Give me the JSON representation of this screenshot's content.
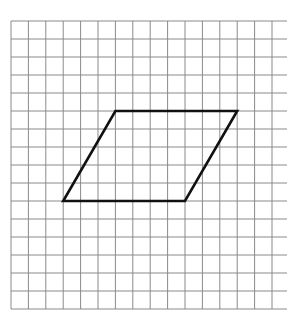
{
  "diagram": {
    "type": "grid-with-parallelogram",
    "grid": {
      "origin_x": 11,
      "origin_y": 21,
      "cell_width": 17.4,
      "cell_height": 18,
      "columns": 15,
      "rows": 16,
      "right_extend_x": 287,
      "line_color": "#8a8a8a"
    },
    "shape": {
      "name": "parallelogram",
      "stroke_color": "#111111",
      "stroke_width": 2.6,
      "vertices_grid": [
        [
          6,
          5
        ],
        [
          13,
          5
        ],
        [
          10,
          10
        ],
        [
          3,
          10
        ]
      ]
    }
  }
}
